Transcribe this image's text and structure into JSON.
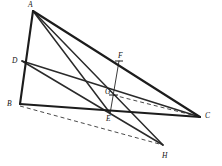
{
  "figure": {
    "background_color": "#ffffff",
    "stroke_color": "#1c1c1c",
    "dashed_color": "#4a4a4a",
    "width": 222,
    "height": 166
  },
  "points": {
    "A": {
      "label": "A",
      "x": 33,
      "y": 11,
      "label_x": 28,
      "label_y": 1
    },
    "B": {
      "label": "B",
      "x": 20,
      "y": 104,
      "label_x": 8,
      "label_y": 100
    },
    "C": {
      "label": "C",
      "x": 200,
      "y": 117,
      "label_x": 206,
      "label_y": 113
    },
    "D": {
      "label": "D",
      "x": 22,
      "y": 61,
      "label_x": 12,
      "label_y": 57
    },
    "E": {
      "label": "E",
      "x": 110,
      "y": 113,
      "label_x": 106,
      "label_y": 116
    },
    "F": {
      "label": "F",
      "x": 119,
      "y": 61,
      "label_x": 118,
      "label_y": 53
    },
    "G": {
      "label": "G",
      "x": 113,
      "y": 95,
      "label_x": 106,
      "label_y": 90
    },
    "H": {
      "label": "H",
      "x": 163,
      "y": 145,
      "label_x": 163,
      "label_y": 152
    }
  },
  "segments": [
    {
      "name": "segment-A-B",
      "from": "A",
      "to": "B",
      "style": "heavy",
      "dashed": false
    },
    {
      "name": "segment-A-C",
      "from": "A",
      "to": "C",
      "style": "heavy",
      "dashed": false
    },
    {
      "name": "segment-B-C",
      "from": "B",
      "to": "C",
      "style": "heavy",
      "dashed": false
    },
    {
      "name": "segment-A-E",
      "from": "A",
      "to": "E",
      "style": "medium",
      "dashed": false
    },
    {
      "name": "segment-A-H",
      "from": "A",
      "to": "H",
      "style": "medium",
      "dashed": false
    },
    {
      "name": "segment-D-C",
      "from": "D",
      "to": "C",
      "style": "medium",
      "dashed": false
    },
    {
      "name": "segment-D-H",
      "from": "D",
      "to": "H",
      "style": "medium",
      "dashed": false
    },
    {
      "name": "segment-F-E",
      "from": "F",
      "to": "E",
      "style": "thin",
      "dashed": false
    },
    {
      "name": "segment-G-C",
      "from": "G",
      "to": "C",
      "style": "dashed",
      "dashed": true
    },
    {
      "name": "segment-B-H",
      "from": "B",
      "to": "H",
      "style": "dashed",
      "dashed": true
    }
  ],
  "labels_order": [
    "A",
    "D",
    "B",
    "F",
    "G",
    "E",
    "C",
    "H"
  ]
}
